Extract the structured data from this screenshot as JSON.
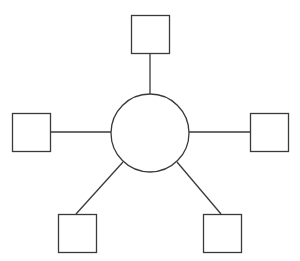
{
  "diagram": {
    "type": "star-topology",
    "stroke_color": "#3a3a3a",
    "fill_color": "#ffffff",
    "hub": {
      "shape": "circle",
      "cx": 150,
      "cy": 133,
      "r": 39
    },
    "nodes": [
      {
        "id": "top",
        "shape": "square",
        "x": 131,
        "y": 15,
        "size": 38,
        "link": {
          "x1": 150,
          "y1": 53,
          "x2": 150,
          "y2": 94
        }
      },
      {
        "id": "left",
        "shape": "square",
        "x": 12,
        "y": 113,
        "size": 38,
        "link": {
          "x1": 50,
          "y1": 132,
          "x2": 111,
          "y2": 132
        }
      },
      {
        "id": "right",
        "shape": "square",
        "x": 250,
        "y": 113,
        "size": 38,
        "link": {
          "x1": 189,
          "y1": 132,
          "x2": 250,
          "y2": 132
        }
      },
      {
        "id": "bottom-left",
        "shape": "square",
        "x": 58,
        "y": 214,
        "size": 38,
        "link": {
          "x1": 76,
          "y1": 214,
          "x2": 123,
          "y2": 162
        }
      },
      {
        "id": "bottom-right",
        "shape": "square",
        "x": 203,
        "y": 214,
        "size": 38,
        "link": {
          "x1": 177,
          "y1": 162,
          "x2": 221,
          "y2": 214
        }
      }
    ]
  }
}
